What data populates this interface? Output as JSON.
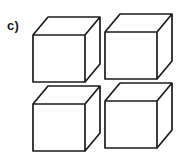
{
  "figure": {
    "option_label": "c)",
    "kind": "multiple-choice-answer-option",
    "cube_count": 4,
    "background_color": "#ffffff",
    "line_color": "#1c1c1c",
    "face_color": "#ffffff",
    "line_width_px": 1.7,
    "canvas": {
      "width": 183,
      "height": 152
    }
  },
  "cube_geometry": {
    "front_face_width": 52,
    "front_face_height": 47,
    "depth_offset_x": 15,
    "depth_offset_y": -18,
    "projection": "oblique-cabinet"
  },
  "cubes": [
    {
      "id": "cube-top-left",
      "row": 1,
      "column": 1,
      "origin_x": 33,
      "origin_y": 35,
      "cropped": false
    },
    {
      "id": "cube-top-right",
      "row": 1,
      "column": 2,
      "origin_x": 105,
      "origin_y": 32,
      "cropped": false
    },
    {
      "id": "cube-bottom-left",
      "row": 2,
      "column": 1,
      "origin_x": 33,
      "origin_y": 104,
      "cropped": true
    },
    {
      "id": "cube-bottom-right",
      "row": 2,
      "column": 2,
      "origin_x": 105,
      "origin_y": 101,
      "cropped": true
    }
  ]
}
